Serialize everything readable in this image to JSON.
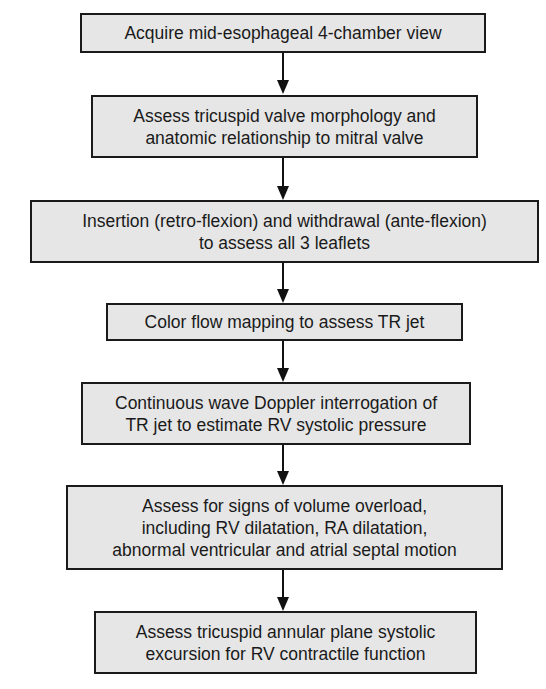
{
  "flowchart": {
    "steps": [
      {
        "text": "Acquire mid-esophageal 4-chamber view"
      },
      {
        "text": "Assess tricuspid valve morphology and\nanatomic relationship to mitral valve"
      },
      {
        "text": "Insertion (retro-flexion) and withdrawal (ante-flexion)\nto assess all 3 leaflets"
      },
      {
        "text": "Color flow mapping to assess TR jet"
      },
      {
        "text": "Continuous wave Doppler interrogation of\nTR jet to estimate RV systolic pressure"
      },
      {
        "text": "Assess for signs of volume overload,\nincluding RV dilatation, RA dilatation,\nabnormal ventricular and atrial septal motion"
      },
      {
        "text": "Assess tricuspid annular plane systolic\nexcursion for RV contractile function"
      }
    ],
    "colors": {
      "box_fill": "#e6e6e6",
      "border": "#1a1a1a",
      "arrow": "#111111"
    }
  }
}
